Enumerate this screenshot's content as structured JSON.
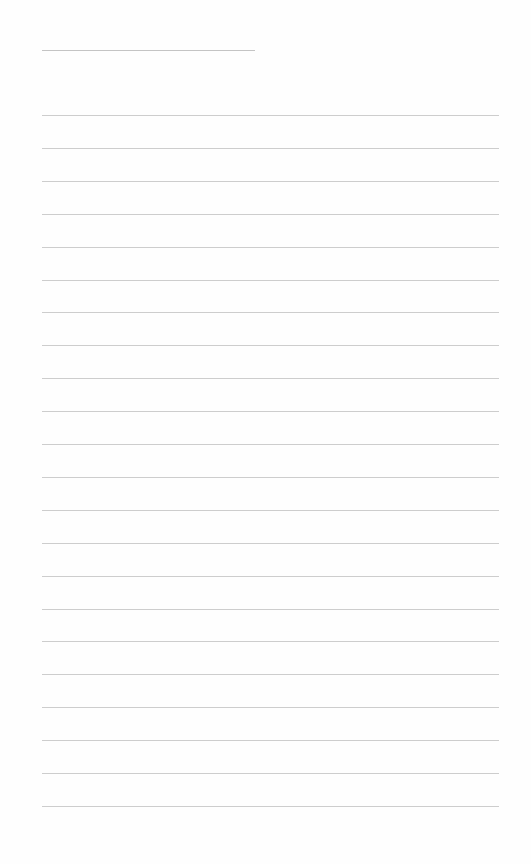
{
  "page": {
    "type": "lined-notepaper",
    "background_color": "#fefefe",
    "line_color": "#cdcdcd",
    "title_line": {
      "x": 42,
      "y": 50,
      "width": 213
    },
    "ruled_lines": {
      "count": 22,
      "x": 42,
      "width": 457,
      "first_y": 115,
      "spacing": 32.9
    }
  }
}
